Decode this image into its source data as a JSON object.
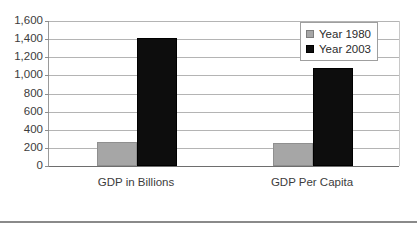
{
  "chart_data": {
    "type": "bar",
    "title": "",
    "xlabel": "",
    "ylabel": "",
    "categories": [
      "GDP in Billions",
      "GDP Per Capita"
    ],
    "series": [
      {
        "name": "Year 1980",
        "color": "#a6a6a6",
        "values": [
          260,
          250
        ]
      },
      {
        "name": "Year 2003",
        "color": "#0d0d0d",
        "values": [
          1410,
          1080
        ]
      }
    ],
    "ylim": [
      0,
      1600
    ],
    "ytick_step": 200,
    "ytick_labels": [
      "1,600",
      "1,400",
      "1,200",
      "1,000",
      "800",
      "600",
      "400",
      "200",
      "0"
    ],
    "ytick_values": [
      1600,
      1400,
      1200,
      1000,
      800,
      600,
      400,
      200,
      0
    ],
    "grid": true,
    "legend_position": "top-right"
  },
  "legend": {
    "items": [
      {
        "label": "Year 1980"
      },
      {
        "label": "Year 2003"
      }
    ]
  }
}
